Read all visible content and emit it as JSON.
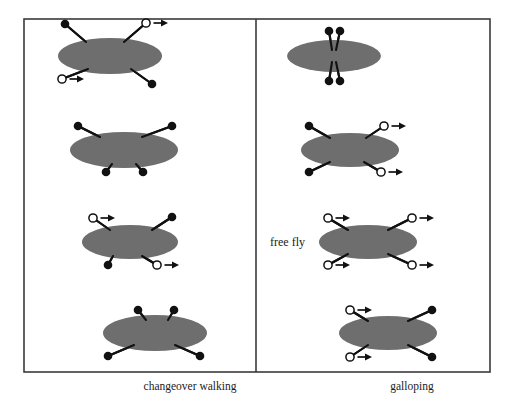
{
  "figure": {
    "type": "gait-diagram",
    "background_color": "#ffffff",
    "frame": {
      "x": 24,
      "y": 19,
      "width": 466,
      "height": 353,
      "stroke_color": "#3a3a3a",
      "stroke_width": 1.6
    },
    "divider": {
      "x": 256,
      "y1": 19,
      "y2": 372,
      "stroke_color": "#3a3a3a",
      "stroke_width": 1.6
    },
    "body_color": "#6e6e6e",
    "leg_color": "#111111",
    "foot_filled_color": "#111111",
    "foot_open_fill": "#ffffff",
    "foot_open_stroke": "#111111",
    "arrow_color": "#111111",
    "legend": {
      "filled_meaning": "foot in stance (on ground)",
      "open_meaning": "foot in swing (moving forward)",
      "arrow_meaning": "direction of swing"
    }
  },
  "captions": {
    "left_panel": "changeover walking",
    "left_panel_x": 190,
    "left_panel_y": 390,
    "right_panel": "galloping",
    "right_panel_x": 412,
    "right_panel_y": 390
  },
  "annotations": [
    {
      "id": "free-fly-label",
      "text": "free fly",
      "x": 305,
      "y": 246,
      "anchor": "end"
    }
  ],
  "panels": [
    {
      "id": "changeover-walking",
      "name": "changeover walking",
      "side": "left",
      "frames": [
        {
          "index": 1,
          "body": {
            "cx": 110,
            "cy": 56,
            "rx": 52,
            "ry": 18
          },
          "legs": [
            {
              "name": "front-left",
              "hip_x": 124,
              "hip_y": 42,
              "foot_x": 146,
              "foot_y": 23,
              "state": "open",
              "arrow": true
            },
            {
              "name": "front-right",
              "hip_x": 86,
              "hip_y": 42,
              "foot_x": 65,
              "foot_y": 24,
              "state": "filled",
              "arrow": false
            },
            {
              "name": "hind-left",
              "hip_x": 131,
              "hip_y": 69,
              "foot_x": 152,
              "foot_y": 84,
              "state": "filled",
              "arrow": false
            },
            {
              "name": "hind-right",
              "hip_x": 88,
              "hip_y": 69,
              "foot_x": 62,
              "foot_y": 79,
              "state": "open",
              "arrow": true
            }
          ]
        },
        {
          "index": 2,
          "body": {
            "cx": 124,
            "cy": 150,
            "rx": 54,
            "ry": 18
          },
          "legs": [
            {
              "name": "front-left",
              "hip_x": 142,
              "hip_y": 137,
              "foot_x": 172,
              "foot_y": 126,
              "state": "filled",
              "arrow": false
            },
            {
              "name": "front-right",
              "hip_x": 100,
              "hip_y": 137,
              "foot_x": 78,
              "foot_y": 126,
              "state": "filled",
              "arrow": false
            },
            {
              "name": "hind-left",
              "hip_x": 136,
              "hip_y": 164,
              "foot_x": 143,
              "foot_y": 172,
              "state": "filled",
              "arrow": false
            },
            {
              "name": "hind-right",
              "hip_x": 112,
              "hip_y": 164,
              "foot_x": 106,
              "foot_y": 172,
              "state": "filled",
              "arrow": false
            }
          ]
        },
        {
          "index": 3,
          "body": {
            "cx": 130,
            "cy": 242,
            "rx": 48,
            "ry": 17
          },
          "legs": [
            {
              "name": "front-left",
              "hip_x": 152,
              "hip_y": 230,
              "foot_x": 172,
              "foot_y": 217,
              "state": "filled",
              "arrow": false
            },
            {
              "name": "front-right",
              "hip_x": 110,
              "hip_y": 230,
              "foot_x": 93,
              "foot_y": 218,
              "state": "open",
              "arrow": true
            },
            {
              "name": "hind-left",
              "hip_x": 142,
              "hip_y": 256,
              "foot_x": 157,
              "foot_y": 265,
              "state": "open",
              "arrow": true
            },
            {
              "name": "hind-right",
              "hip_x": 113,
              "hip_y": 256,
              "foot_x": 108,
              "foot_y": 265,
              "state": "filled",
              "arrow": false
            }
          ]
        },
        {
          "index": 4,
          "body": {
            "cx": 155,
            "cy": 333,
            "rx": 52,
            "ry": 18
          },
          "legs": [
            {
              "name": "front-left",
              "hip_x": 168,
              "hip_y": 320,
              "foot_x": 174,
              "foot_y": 310,
              "state": "filled",
              "arrow": false
            },
            {
              "name": "front-right",
              "hip_x": 146,
              "hip_y": 320,
              "foot_x": 138,
              "foot_y": 310,
              "state": "filled",
              "arrow": false
            },
            {
              "name": "hind-left",
              "hip_x": 175,
              "hip_y": 345,
              "foot_x": 200,
              "foot_y": 356,
              "state": "filled",
              "arrow": false
            },
            {
              "name": "hind-right",
              "hip_x": 134,
              "hip_y": 345,
              "foot_x": 108,
              "foot_y": 356,
              "state": "filled",
              "arrow": false
            }
          ]
        }
      ]
    },
    {
      "id": "galloping",
      "name": "galloping",
      "side": "right",
      "frames": [
        {
          "index": 1,
          "body": {
            "cx": 334,
            "cy": 56,
            "rx": 47,
            "ry": 16
          },
          "legs": [
            {
              "name": "front-left",
              "hip_x": 336,
              "hip_y": 50,
              "foot_x": 340,
              "foot_y": 31,
              "state": "filled",
              "arrow": false
            },
            {
              "name": "front-right",
              "hip_x": 332,
              "hip_y": 50,
              "foot_x": 329,
              "foot_y": 31,
              "state": "filled",
              "arrow": false
            },
            {
              "name": "hind-left",
              "hip_x": 336,
              "hip_y": 62,
              "foot_x": 340,
              "foot_y": 81,
              "state": "filled",
              "arrow": false
            },
            {
              "name": "hind-right",
              "hip_x": 332,
              "hip_y": 62,
              "foot_x": 329,
              "foot_y": 81,
              "state": "filled",
              "arrow": false
            }
          ]
        },
        {
          "index": 2,
          "body": {
            "cx": 350,
            "cy": 150,
            "rx": 49,
            "ry": 17
          },
          "legs": [
            {
              "name": "front-left",
              "hip_x": 366,
              "hip_y": 138,
              "foot_x": 384,
              "foot_y": 126,
              "state": "open",
              "arrow": true
            },
            {
              "name": "front-right",
              "hip_x": 330,
              "hip_y": 138,
              "foot_x": 309,
              "foot_y": 126,
              "state": "filled",
              "arrow": false
            },
            {
              "name": "hind-left",
              "hip_x": 364,
              "hip_y": 162,
              "foot_x": 381,
              "foot_y": 172,
              "state": "open",
              "arrow": true
            },
            {
              "name": "hind-right",
              "hip_x": 330,
              "hip_y": 162,
              "foot_x": 309,
              "foot_y": 172,
              "state": "filled",
              "arrow": false
            }
          ]
        },
        {
          "index": 3,
          "body": {
            "cx": 368,
            "cy": 242,
            "rx": 49,
            "ry": 17
          },
          "legs": [
            {
              "name": "front-left",
              "hip_x": 388,
              "hip_y": 230,
              "foot_x": 412,
              "foot_y": 218,
              "state": "open",
              "arrow": true
            },
            {
              "name": "front-right",
              "hip_x": 348,
              "hip_y": 230,
              "foot_x": 328,
              "foot_y": 218,
              "state": "open",
              "arrow": true
            },
            {
              "name": "hind-left",
              "hip_x": 388,
              "hip_y": 254,
              "foot_x": 412,
              "foot_y": 265,
              "state": "open",
              "arrow": true
            },
            {
              "name": "hind-right",
              "hip_x": 348,
              "hip_y": 254,
              "foot_x": 328,
              "foot_y": 265,
              "state": "open",
              "arrow": true
            }
          ]
        },
        {
          "index": 4,
          "body": {
            "cx": 388,
            "cy": 333,
            "rx": 49,
            "ry": 17
          },
          "legs": [
            {
              "name": "front-left",
              "hip_x": 408,
              "hip_y": 321,
              "foot_x": 432,
              "foot_y": 310,
              "state": "filled",
              "arrow": false
            },
            {
              "name": "front-right",
              "hip_x": 368,
              "hip_y": 321,
              "foot_x": 350,
              "foot_y": 310,
              "state": "open",
              "arrow": true
            },
            {
              "name": "hind-left",
              "hip_x": 408,
              "hip_y": 345,
              "foot_x": 432,
              "foot_y": 357,
              "state": "filled",
              "arrow": false
            },
            {
              "name": "hind-right",
              "hip_x": 368,
              "hip_y": 345,
              "foot_x": 350,
              "foot_y": 357,
              "state": "open",
              "arrow": true
            }
          ]
        }
      ]
    }
  ]
}
